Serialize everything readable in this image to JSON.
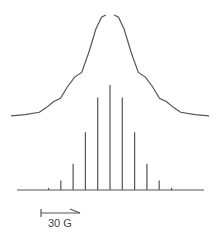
{
  "chart_data": {
    "type": "line",
    "title": "",
    "xlabel": "",
    "ylabel": "",
    "grid": false,
    "legend": "none",
    "spectrum": {
      "name": "experimental spectrum",
      "x": [
        -7,
        -6,
        -5,
        -4.5,
        -4,
        -3.5,
        -3,
        -2.5,
        -2,
        -1.5,
        -1,
        -0.6,
        -0.3,
        0.3,
        0.6,
        1,
        1.5,
        2,
        2.5,
        3,
        3.5,
        4,
        4.5,
        5,
        6,
        7
      ],
      "y": [
        0.01,
        0.02,
        0.04,
        0.08,
        0.13,
        0.16,
        0.26,
        0.34,
        0.38,
        0.55,
        0.75,
        0.85,
        1.0,
        1.0,
        0.85,
        0.75,
        0.55,
        0.38,
        0.34,
        0.26,
        0.16,
        0.13,
        0.08,
        0.04,
        0.02,
        0.01
      ]
    },
    "stick_spectrum": {
      "name": "simulated stick spectrum",
      "positions": [
        -5,
        -4,
        -3,
        -2,
        -1,
        0,
        1,
        2,
        3,
        4,
        5
      ],
      "intensities": [
        0.02,
        0.09,
        0.25,
        0.55,
        0.88,
        1.0,
        0.88,
        0.55,
        0.25,
        0.09,
        0.02
      ]
    },
    "scale_bar": {
      "label": "30 G",
      "value_gauss": 30
    }
  }
}
